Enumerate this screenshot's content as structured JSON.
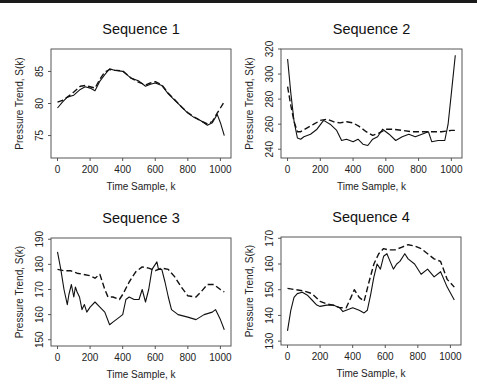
{
  "chart_data": [
    {
      "type": "line",
      "title": "Sequence 1",
      "xlabel": "Time Sample, k",
      "ylabel": "Pressure Trend, S(k)",
      "xlim": [
        -40,
        1065
      ],
      "ylim": [
        71.5,
        88.5
      ],
      "xticks": [
        0,
        200,
        400,
        600,
        800,
        1000
      ],
      "yticks": [
        75,
        80,
        85
      ],
      "grid": false,
      "legend": null,
      "box": {
        "left": 51,
        "top": 49,
        "right": 231,
        "bottom": 158
      },
      "series": [
        {
          "name": "measured",
          "style": "solid",
          "x": [
            0,
            30,
            60,
            100,
            140,
            170,
            200,
            230,
            260,
            290,
            320,
            350,
            400,
            450,
            500,
            540,
            570,
            600,
            640,
            680,
            720,
            760,
            800,
            840,
            880,
            920,
            950,
            980,
            1000,
            1024
          ],
          "y": [
            79.3,
            80.2,
            81.0,
            81.3,
            82.2,
            82.6,
            82.4,
            82.0,
            83.5,
            84.5,
            85.4,
            85.2,
            85.0,
            84.0,
            83.5,
            82.7,
            83.0,
            83.2,
            82.8,
            81.5,
            80.5,
            79.5,
            78.5,
            77.8,
            77.3,
            76.6,
            77.0,
            78.3,
            77.0,
            75.0
          ]
        },
        {
          "name": "trend estimate",
          "style": "dashed",
          "x": [
            0,
            30,
            60,
            100,
            140,
            170,
            200,
            230,
            260,
            290,
            320,
            350,
            400,
            450,
            500,
            540,
            570,
            600,
            640,
            680,
            720,
            760,
            800,
            840,
            880,
            920,
            950,
            980,
            1000,
            1024
          ],
          "y": [
            80.2,
            80.5,
            81.0,
            81.8,
            82.7,
            82.8,
            82.6,
            82.4,
            83.8,
            84.9,
            85.3,
            85.2,
            85.1,
            84.0,
            83.3,
            82.9,
            83.2,
            83.4,
            82.9,
            81.6,
            80.6,
            79.5,
            78.6,
            77.9,
            77.3,
            76.8,
            77.2,
            78.5,
            79.3,
            80.3
          ]
        }
      ]
    },
    {
      "type": "line",
      "title": "Sequence 2",
      "xlabel": "Time Sample, k",
      "ylabel": "Pressure Trend, S(k)",
      "xlim": [
        -40,
        1065
      ],
      "ylim": [
        233,
        320
      ],
      "xticks": [
        0,
        200,
        400,
        600,
        800,
        1000
      ],
      "yticks": [
        240,
        260,
        280,
        300,
        320
      ],
      "grid": false,
      "legend": null,
      "box": {
        "left": 281,
        "top": 49,
        "right": 462,
        "bottom": 158
      },
      "series": [
        {
          "name": "measured",
          "style": "solid",
          "x": [
            0,
            20,
            40,
            60,
            80,
            100,
            140,
            180,
            220,
            260,
            300,
            330,
            360,
            400,
            430,
            460,
            490,
            520,
            550,
            580,
            620,
            660,
            700,
            740,
            780,
            820,
            860,
            880,
            920,
            960,
            980,
            1000,
            1024
          ],
          "y": [
            312,
            285,
            262,
            249,
            248,
            250,
            252,
            256,
            263,
            260,
            255,
            247,
            248,
            246,
            248,
            244,
            243,
            248,
            250,
            256,
            252,
            247,
            250,
            252,
            250,
            252,
            254,
            246,
            247,
            247,
            260,
            285,
            315
          ]
        },
        {
          "name": "trend estimate",
          "style": "dashed",
          "x": [
            0,
            20,
            40,
            60,
            80,
            120,
            160,
            200,
            240,
            280,
            320,
            360,
            400,
            440,
            480,
            520,
            560,
            600,
            640,
            700,
            760,
            820,
            880,
            940,
            1000,
            1024
          ],
          "y": [
            290,
            275,
            262,
            254,
            254,
            257,
            260,
            263,
            264,
            262,
            261,
            262,
            261,
            258,
            254,
            251,
            253,
            256,
            256,
            255,
            254,
            254,
            254,
            254,
            255,
            255
          ]
        }
      ]
    },
    {
      "type": "line",
      "title": "Sequence 3",
      "xlabel": "Time Sample, k",
      "ylabel": "Pressure Trend, S(k)",
      "xlim": [
        -40,
        1065
      ],
      "ylim": [
        147.5,
        190.5
      ],
      "xticks": [
        0,
        200,
        400,
        600,
        800,
        1000
      ],
      "yticks": [
        150,
        160,
        170,
        180,
        190
      ],
      "grid": false,
      "legend": null,
      "box": {
        "left": 51,
        "top": 238,
        "right": 231,
        "bottom": 346
      },
      "series": [
        {
          "name": "measured",
          "style": "solid",
          "x": [
            0,
            20,
            40,
            60,
            70,
            85,
            100,
            110,
            120,
            135,
            150,
            165,
            180,
            200,
            230,
            260,
            290,
            320,
            340,
            360,
            400,
            420,
            440,
            470,
            500,
            520,
            540,
            560,
            580,
            600,
            610,
            620,
            640,
            660,
            680,
            700,
            740,
            800,
            850,
            900,
            950,
            970,
            1000,
            1024
          ],
          "y": [
            185,
            178,
            170,
            164,
            168,
            172,
            167,
            171,
            169,
            167,
            162,
            164,
            161,
            163,
            165,
            163,
            161,
            156,
            157,
            158,
            160,
            166,
            167,
            166,
            166,
            170,
            165,
            170,
            178,
            180,
            181,
            178,
            178,
            173,
            167,
            162,
            160,
            159,
            158,
            160,
            161,
            162,
            158,
            154
          ]
        },
        {
          "name": "trend estimate",
          "style": "dashed",
          "x": [
            0,
            40,
            80,
            120,
            160,
            200,
            230,
            260,
            290,
            310,
            340,
            380,
            400,
            440,
            480,
            520,
            560,
            600,
            640,
            680,
            720,
            760,
            800,
            850,
            880,
            920,
            960,
            1000,
            1024
          ],
          "y": [
            178,
            177.5,
            177.5,
            176.5,
            176,
            175.5,
            174.5,
            176,
            170,
            167,
            167,
            166,
            168,
            173,
            177,
            179,
            178.5,
            177.5,
            178.5,
            178,
            175,
            171,
            167.5,
            167,
            169,
            172,
            172,
            170,
            169
          ]
        }
      ]
    },
    {
      "type": "line",
      "title": "Sequence 4",
      "xlabel": "Time Sample, k",
      "ylabel": "Pressure Trend, S(k)",
      "xlim": [
        -40,
        1065
      ],
      "ylim": [
        128.5,
        170.5
      ],
      "xticks": [
        0,
        200,
        400,
        600,
        800,
        1000
      ],
      "yticks": [
        130,
        140,
        150,
        160,
        170
      ],
      "grid": false,
      "legend": null,
      "box": {
        "left": 281,
        "top": 237,
        "right": 461,
        "bottom": 345
      },
      "series": [
        {
          "name": "measured",
          "style": "solid",
          "x": [
            0,
            20,
            40,
            60,
            90,
            120,
            150,
            180,
            200,
            240,
            280,
            320,
            340,
            360,
            400,
            440,
            470,
            490,
            510,
            530,
            550,
            570,
            590,
            610,
            630,
            650,
            670,
            690,
            720,
            740,
            780,
            820,
            860,
            900,
            940,
            980,
            1024
          ],
          "y": [
            134,
            142,
            147,
            148.5,
            149,
            148,
            146,
            144,
            143.5,
            144,
            144,
            143,
            141.5,
            142,
            143,
            142,
            141,
            142,
            148,
            155,
            160,
            158,
            163,
            164,
            161,
            158,
            160,
            161,
            164,
            162,
            160,
            156,
            158,
            155,
            157,
            151,
            146
          ]
        },
        {
          "name": "trend estimate",
          "style": "dashed",
          "x": [
            0,
            50,
            100,
            150,
            200,
            240,
            280,
            320,
            360,
            390,
            410,
            440,
            470,
            500,
            530,
            560,
            590,
            620,
            660,
            700,
            740,
            780,
            820,
            860,
            900,
            940,
            980,
            1024
          ],
          "y": [
            150.5,
            150,
            149.5,
            148.5,
            145.5,
            144.5,
            144,
            143,
            143,
            147,
            150,
            147,
            145.5,
            153,
            160,
            164,
            166,
            165.5,
            165.5,
            166.5,
            167.5,
            167,
            166,
            164,
            162,
            161,
            154,
            151
          ]
        }
      ]
    }
  ]
}
